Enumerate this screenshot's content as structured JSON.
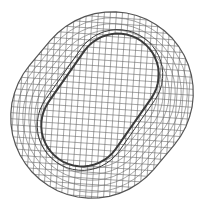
{
  "figure": {
    "title": "",
    "description": "Finite element surface mesh of a stadium-shaped (obround) part with a raised inner obround region, viewed obliquely",
    "colors": {
      "background": "#ffffff",
      "mesh_line": "#6a6a6a",
      "outer_edge": "#555555",
      "inner_edge": "#3a3a3a"
    },
    "outer_shape": {
      "center": [
        102,
        105
      ],
      "rotation_deg": -50,
      "width": 162,
      "straight_length": 32
    },
    "inner_shape": {
      "center": [
        100,
        100
      ],
      "rotation_deg": -55,
      "width": 82,
      "straight_length": 62
    },
    "mesh_spacing": 6
  }
}
